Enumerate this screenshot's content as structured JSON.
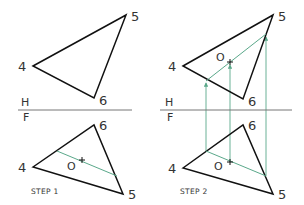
{
  "colors": {
    "edge": "#111111",
    "construction": "#5aa88a",
    "plane_line": "#777777",
    "label": "#333333",
    "background": "#ffffff"
  },
  "step1": {
    "caption": "STEP 1",
    "top_view": {
      "vertices": [
        {
          "label": "4",
          "x": 33,
          "y": 66
        },
        {
          "label": "5",
          "x": 126,
          "y": 15
        },
        {
          "label": "6",
          "x": 94,
          "y": 98
        }
      ]
    },
    "fold_line": {
      "upper_label": "H",
      "lower_label": "F",
      "x1": 18,
      "x2": 132,
      "y": 110
    },
    "front_view": {
      "vertices": [
        {
          "label": "4",
          "x": 33,
          "y": 167
        },
        {
          "label": "6",
          "x": 94,
          "y": 125
        },
        {
          "label": "5",
          "x": 123,
          "y": 194
        }
      ],
      "line": {
        "x1": 57,
        "y1": 151,
        "x2": 117,
        "y2": 176
      },
      "point_label": "O",
      "point": {
        "x": 82,
        "y": 160
      }
    }
  },
  "step2": {
    "caption": "STEP 2",
    "top_view": {
      "vertices": [
        {
          "label": "4",
          "x": 183,
          "y": 66
        },
        {
          "label": "5",
          "x": 273,
          "y": 15
        },
        {
          "label": "6",
          "x": 243,
          "y": 99
        }
      ],
      "line": {
        "x1": 206,
        "y1": 81,
        "x2": 266,
        "y2": 34
      },
      "point_label": "O",
      "point": {
        "x": 230,
        "y": 62
      }
    },
    "fold_line": {
      "upper_label": "H",
      "lower_label": "F",
      "x1": 160,
      "x2": 292,
      "y": 110
    },
    "front_view": {
      "vertices": [
        {
          "label": "4",
          "x": 183,
          "y": 168
        },
        {
          "label": "6",
          "x": 243,
          "y": 125
        },
        {
          "label": "5",
          "x": 273,
          "y": 194
        }
      ],
      "line": {
        "x1": 206,
        "y1": 151,
        "x2": 266,
        "y2": 176
      },
      "point_label": "O",
      "point": {
        "x": 230,
        "y": 162
      }
    },
    "projectors": [
      {
        "x": 206,
        "y_bottom": 151,
        "y_top": 81
      },
      {
        "x": 230,
        "y_bottom": 162,
        "y_top": 62
      },
      {
        "x": 266,
        "y_bottom": 176,
        "y_top": 34
      }
    ]
  }
}
